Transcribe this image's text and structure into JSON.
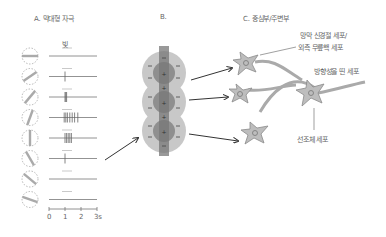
{
  "panels": {
    "a": {
      "title": "A. 막대형 자극",
      "stimulus_label": "빛",
      "rows": [
        {
          "orientation_deg": 0,
          "spikes": []
        },
        {
          "orientation_deg": -35,
          "spikes": [
            1.0
          ]
        },
        {
          "orientation_deg": -50,
          "spikes": [
            1.0,
            1.05,
            1.1
          ]
        },
        {
          "orientation_deg": -70,
          "spikes": [
            0.95,
            1.05,
            1.15,
            1.3,
            1.45,
            1.6,
            1.8
          ]
        },
        {
          "orientation_deg": 90,
          "spikes": [
            1.0,
            1.1,
            1.2,
            1.3,
            1.4
          ]
        },
        {
          "orientation_deg": 60,
          "spikes": [
            1.0
          ]
        },
        {
          "orientation_deg": 40,
          "spikes": []
        },
        {
          "orientation_deg": 20,
          "spikes": []
        }
      ],
      "axis": {
        "ticks": [
          "0",
          "1",
          "2",
          "3s"
        ]
      }
    },
    "b": {
      "title": "B."
    },
    "c": {
      "title": "C. 중심부/주변부",
      "labels": {
        "retinal_line1": "망막 신경절 세포/",
        "retinal_line2": "외측 무릎핵 세포",
        "oriented": "방향성을 띤 세포",
        "striate": "선조체 세포"
      }
    }
  },
  "colors": {
    "neuron_fill": "#bdbdbd",
    "neuron_stroke": "#8a8a8a",
    "field_light": "#c8c8c8",
    "field_dark": "#7a7a7a",
    "line": "#333333"
  }
}
